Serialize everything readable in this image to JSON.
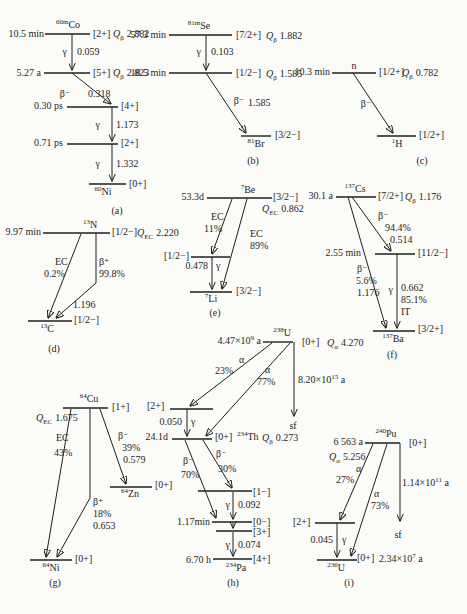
{
  "colors": {
    "ink": "#1f1f1f",
    "paper": "#fbfbf8"
  },
  "glyphs": {
    "Q": "Q",
    "gamma": "γ",
    "alpha": "α",
    "beta_minus": "β⁻",
    "beta_plus": "β⁺",
    "EC": "EC",
    "IT": "IT",
    "sf": "sf"
  },
  "sch": {
    "a": {
      "cap": "(a)",
      "nuc": [
        {
          "m": "60m",
          "s": "Co"
        },
        {
          "m": "60",
          "s": "Ni"
        }
      ],
      "hl": [
        "10.5 min",
        "5.27 a",
        "0.30 ps",
        "0.71 ps"
      ],
      "spins": [
        "[2+]",
        "[5+]",
        "[4+]",
        "[2+]",
        "[0+]"
      ],
      "q": [
        {
          "sub": "β",
          "v": "2.882"
        },
        {
          "sub": "β",
          "v": "2.823"
        }
      ],
      "g1": "0.059",
      "g2": "1.173",
      "g3": "1.332",
      "b1": "0.318"
    },
    "b": {
      "cap": "(b)",
      "nuc": [
        {
          "m": "81m",
          "s": "Se"
        },
        {
          "m": "81",
          "s": "Br"
        }
      ],
      "hl": [
        "57.3 min",
        "18.5 min"
      ],
      "spins": [
        "[7/2+]",
        "[1/2−]",
        "[3/2−]"
      ],
      "q": [
        {
          "sub": "β",
          "v": "1.882"
        },
        {
          "sub": "β",
          "v": "1.585"
        }
      ],
      "g1": "0.103",
      "b1": "1.585"
    },
    "c": {
      "cap": "(c)",
      "nuc": [
        {
          "m": "",
          "s": "n"
        },
        {
          "m": "1",
          "s": "H"
        }
      ],
      "hl": [
        "10.3 min"
      ],
      "spins": [
        "[1/2+]",
        "[1/2+]"
      ],
      "q": [
        {
          "sub": "β",
          "v": "0.782"
        }
      ]
    },
    "d": {
      "cap": "(d)",
      "nuc": [
        {
          "m": "13",
          "s": "N"
        },
        {
          "m": "13",
          "s": "C"
        }
      ],
      "hl": [
        "9.97 min"
      ],
      "spins": [
        "[1/2−]",
        "[1/2−]"
      ],
      "q": [
        {
          "sub": "EC",
          "v": "2.220"
        }
      ],
      "ec_pct": "0.2%",
      "bp_pct": "99.8%",
      "bp_v": "1.196"
    },
    "e": {
      "cap": "(e)",
      "nuc": [
        {
          "m": "7",
          "s": "Be"
        },
        {
          "m": "7",
          "s": "Li"
        }
      ],
      "hl": [
        "53.3d"
      ],
      "spins": [
        "[3/2−]",
        "[1/2−]",
        "[3/2−]"
      ],
      "q": [
        {
          "sub": "EC",
          "v": "0.862"
        }
      ],
      "ec1_pct": "11%",
      "ec2_pct": "89%",
      "g1": "0.478"
    },
    "f": {
      "cap": "(f)",
      "nuc": [
        {
          "m": "137",
          "s": "Cs"
        },
        {
          "m": "137",
          "s": "Ba"
        }
      ],
      "hl": [
        "30.1 a",
        "2.55 min"
      ],
      "spins": [
        "[7/2+]",
        "[11/2−]",
        "[3/2+]"
      ],
      "q": [
        {
          "sub": "β",
          "v": "1.176"
        }
      ],
      "b1_pct": "94.4%",
      "b1_v": "0.514",
      "b2_pct": "5.6%",
      "b2_v": "1.176",
      "g1": "0.662",
      "g1_pct": "85.1%"
    },
    "g": {
      "cap": "(g)",
      "nuc": [
        {
          "m": "64",
          "s": "Cu"
        },
        {
          "m": "64",
          "s": "Zn"
        },
        {
          "m": "64",
          "s": "Ni"
        }
      ],
      "spins": [
        "[1+]",
        "[0+]",
        "[0+]"
      ],
      "q": [
        {
          "sub": "EC",
          "v": "1.675"
        }
      ],
      "ec_pct": "43%",
      "b1_pct": "39%",
      "b1_v": "0.579",
      "b2_pct": "18%",
      "b2_v": "0.653"
    },
    "h": {
      "cap": "(h)",
      "nuc": [
        {
          "m": "238",
          "s": "U"
        },
        {
          "m": "234",
          "s": "Th"
        },
        {
          "m": "234",
          "s": "Pa"
        }
      ],
      "hl": [
        {
          "b": "4.47×10",
          "e": "9",
          "u": " a"
        },
        {
          "b": "8.20×10",
          "e": "15",
          "u": " a"
        },
        "24.1d",
        "1.17min",
        "6.70 h"
      ],
      "spins": [
        "[0+]",
        "[2+]",
        "[0+]",
        "[1−]",
        "[0−]",
        "[3+]",
        "[4+]"
      ],
      "q": [
        {
          "sub": "α",
          "v": "4.270"
        },
        {
          "sub": "β",
          "v": "0.273"
        }
      ],
      "a1_pct": "23%",
      "a2_pct": "77%",
      "g1": "0.050",
      "b1_pct": "70%",
      "b2_pct": "30%",
      "g2": "0.092",
      "g3": "0.074"
    },
    "i": {
      "cap": "(i)",
      "nuc": [
        {
          "m": "240",
          "s": "Pu"
        },
        {
          "m": "236",
          "s": "U"
        }
      ],
      "hl": [
        "6 563 a",
        {
          "b": "1.14×10",
          "e": "11",
          "u": " a"
        },
        {
          "b": "2.34×10",
          "e": "7",
          "u": " a"
        }
      ],
      "spins": [
        "[0+]",
        "[2+]",
        "[0+]"
      ],
      "q": [
        {
          "sub": "α",
          "v": "5.256"
        }
      ],
      "a1_pct": "27%",
      "a2_pct": "73%",
      "g1": "0.045"
    }
  }
}
